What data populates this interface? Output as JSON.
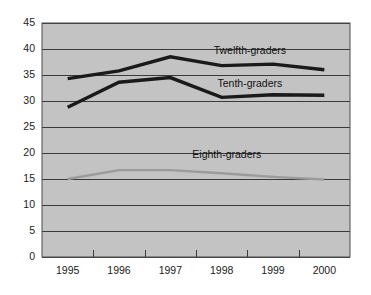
{
  "chart_data": {
    "type": "line",
    "title": "",
    "subtitle": "",
    "xlabel": "",
    "ylabel": "",
    "categories": [
      "1995",
      "1996",
      "1997",
      "1998",
      "1999",
      "2000"
    ],
    "x": [
      1995,
      1996,
      1997,
      1998,
      1999,
      2000
    ],
    "ylim": [
      0,
      45
    ],
    "ytick_values": [
      0,
      5,
      10,
      15,
      20,
      25,
      30,
      35,
      40,
      45
    ],
    "ytick_labels": [
      "0",
      "5",
      "10",
      "15",
      "20",
      "25",
      "30",
      "35",
      "40",
      "45"
    ],
    "grid": true,
    "grid_axis": "y",
    "legend": "inline-annotations",
    "legend_position": "on-plot",
    "plot_background": "#c3c3c3",
    "page_background": "#ffffff",
    "series": [
      {
        "name": "Twelfth-graders",
        "color": "#1a1a1a",
        "width": 3.4,
        "values": [
          34.3,
          35.8,
          38.5,
          36.8,
          37.1,
          36.0
        ],
        "annotation": {
          "label": "Twelfth-graders",
          "x_value": 1998.55,
          "y_value": 39.6
        }
      },
      {
        "name": "Tenth-graders",
        "color": "#1a1a1a",
        "width": 3.4,
        "values": [
          28.8,
          33.6,
          34.5,
          30.7,
          31.2,
          31.1
        ],
        "annotation": {
          "label": "Tenth-graders",
          "x_value": 1998.55,
          "y_value": 33.3
        }
      },
      {
        "name": "Eighth-graders",
        "color": "#9b9b9b",
        "width": 2.4,
        "values": [
          15.0,
          16.7,
          16.7,
          16.1,
          15.4,
          14.9
        ],
        "annotation": {
          "label": "Eighth-graders",
          "x_value": 1998.1,
          "y_value": 19.6
        }
      }
    ],
    "annotations": [
      "Twelfth-graders",
      "Tenth-graders",
      "Eighth-graders"
    ]
  },
  "geometry": {
    "plot_left": 42,
    "plot_right": 350,
    "plot_top": 23,
    "plot_bottom": 257
  }
}
